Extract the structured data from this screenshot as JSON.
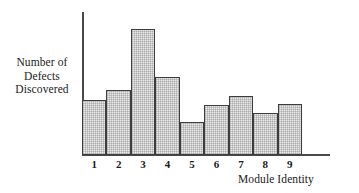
{
  "chart_data": {
    "type": "bar",
    "title": "",
    "xlabel": "Module Identity",
    "ylabel": "Number of Defects Discovered",
    "ylabel_lines": [
      "Number of",
      "Defects",
      "Discovered"
    ],
    "categories": [
      "1",
      "2",
      "3",
      "4",
      "5",
      "6",
      "7",
      "8",
      "9"
    ],
    "values": [
      55,
      65,
      126,
      78,
      33,
      50,
      59,
      42,
      51
    ],
    "ylim": [
      0,
      143
    ],
    "grid": false,
    "legend": false,
    "axis_ticks_y": [],
    "bar_fill_color": "#e9e9e9",
    "bar_edge_color": "#3d3d3d",
    "axis_color": "#4a4a4a",
    "series": [
      {
        "name": "Defects Discovered",
        "values": [
          55,
          65,
          126,
          78,
          33,
          50,
          59,
          42,
          51
        ]
      }
    ]
  }
}
